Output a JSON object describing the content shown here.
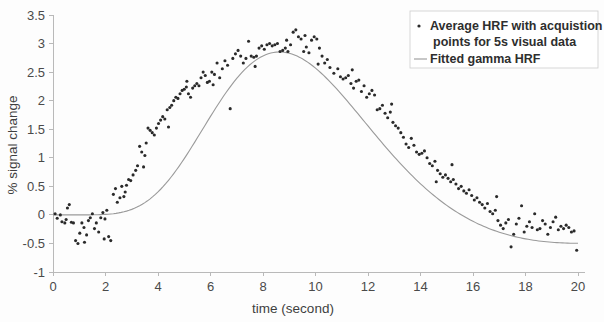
{
  "chart_data": {
    "type": "scatter",
    "title": "",
    "xlabel": "time (second)",
    "ylabel": "% signal change",
    "xlim": [
      0,
      20
    ],
    "ylim": [
      -1,
      3.5
    ],
    "xticks": [
      0,
      2,
      4,
      6,
      8,
      10,
      12,
      14,
      16,
      18,
      20
    ],
    "xtick_labels": [
      "0",
      "2",
      "4",
      "6",
      "8",
      "10",
      "12",
      "14",
      "16",
      "18",
      "20"
    ],
    "yticks": [
      -1,
      -0.5,
      0,
      0.5,
      1,
      1.5,
      2,
      2.5,
      3,
      3.5
    ],
    "ytick_labels": [
      "-1",
      "-0.5",
      "0",
      "0.5",
      "1",
      "1.5",
      "2",
      "2.5",
      "3",
      "3.5"
    ],
    "grid": false,
    "legend_position": "top-right",
    "legend": [
      {
        "id": "scatter-series",
        "marker": "dot",
        "color": "#2a2a2a",
        "label_line1": "Average HRF with acquistion",
        "label_line2": "points for 5s visual data"
      },
      {
        "id": "fit-series",
        "marker": "line",
        "color": "#9a9a9a",
        "label_line1": "Fitted gamma HRF",
        "label_line2": ""
      }
    ],
    "series": [
      {
        "name": "Average HRF with acquistion points for 5s visual data",
        "type": "scatter",
        "color": "#2a2a2a",
        "points": [
          [
            0.08,
            0.02
          ],
          [
            0.16,
            -0.06
          ],
          [
            0.28,
            0.0
          ],
          [
            0.34,
            -0.12
          ],
          [
            0.45,
            -0.14
          ],
          [
            0.55,
            0.12
          ],
          [
            0.62,
            0.18
          ],
          [
            0.7,
            -0.13
          ],
          [
            0.78,
            -0.14
          ],
          [
            0.86,
            -0.45
          ],
          [
            0.95,
            -0.5
          ],
          [
            1.02,
            -0.32
          ],
          [
            1.1,
            -0.14
          ],
          [
            1.18,
            -0.22
          ],
          [
            1.28,
            -0.35
          ],
          [
            1.35,
            -0.1
          ],
          [
            1.42,
            -0.05
          ],
          [
            1.5,
            0.02
          ],
          [
            1.58,
            -0.24
          ],
          [
            1.65,
            -0.14
          ],
          [
            1.74,
            -0.3
          ],
          [
            1.82,
            -0.05
          ],
          [
            1.9,
            0.04
          ],
          [
            1.98,
            -0.07
          ],
          [
            2.05,
            0.08
          ],
          [
            2.12,
            -0.38
          ],
          [
            2.2,
            -0.45
          ],
          [
            2.3,
            0.36
          ],
          [
            2.38,
            0.46
          ],
          [
            2.45,
            0.22
          ],
          [
            2.55,
            0.3
          ],
          [
            2.62,
            0.5
          ],
          [
            2.7,
            0.32
          ],
          [
            2.8,
            0.52
          ],
          [
            2.88,
            0.62
          ],
          [
            2.96,
            0.6
          ],
          [
            3.05,
            0.7
          ],
          [
            3.15,
            0.78
          ],
          [
            3.22,
            0.86
          ],
          [
            3.3,
            1.2
          ],
          [
            3.38,
            1.1
          ],
          [
            3.45,
            0.84
          ],
          [
            3.55,
            1.26
          ],
          [
            3.62,
            1.52
          ],
          [
            3.7,
            1.48
          ],
          [
            3.78,
            1.44
          ],
          [
            3.86,
            1.4
          ],
          [
            3.94,
            1.52
          ],
          [
            4.02,
            1.6
          ],
          [
            4.1,
            1.66
          ],
          [
            4.18,
            1.72
          ],
          [
            4.26,
            1.68
          ],
          [
            4.35,
            1.84
          ],
          [
            4.45,
            1.88
          ],
          [
            4.52,
            1.92
          ],
          [
            4.6,
            2.0
          ],
          [
            4.68,
            2.06
          ],
          [
            4.76,
            2.04
          ],
          [
            4.84,
            2.12
          ],
          [
            4.92,
            2.18
          ],
          [
            5.0,
            2.2
          ],
          [
            5.08,
            2.24
          ],
          [
            5.16,
            2.12
          ],
          [
            5.24,
            2.06
          ],
          [
            5.32,
            2.22
          ],
          [
            5.4,
            2.26
          ],
          [
            5.48,
            2.3
          ],
          [
            5.56,
            2.26
          ],
          [
            5.64,
            2.4
          ],
          [
            5.72,
            2.5
          ],
          [
            5.8,
            2.44
          ],
          [
            5.88,
            2.32
          ],
          [
            5.96,
            2.34
          ],
          [
            6.05,
            2.5
          ],
          [
            6.15,
            2.46
          ],
          [
            6.25,
            2.66
          ],
          [
            6.35,
            2.4
          ],
          [
            6.45,
            2.56
          ],
          [
            6.55,
            2.7
          ],
          [
            6.65,
            2.62
          ],
          [
            6.75,
            1.86
          ],
          [
            6.85,
            2.74
          ],
          [
            6.95,
            2.82
          ],
          [
            7.05,
            2.88
          ],
          [
            7.15,
            2.78
          ],
          [
            7.25,
            2.66
          ],
          [
            7.35,
            2.74
          ],
          [
            7.45,
            3.04
          ],
          [
            7.55,
            2.78
          ],
          [
            7.65,
            2.76
          ],
          [
            7.75,
            2.78
          ],
          [
            7.85,
            2.92
          ],
          [
            7.95,
            2.96
          ],
          [
            8.05,
            2.9
          ],
          [
            8.15,
            2.98
          ],
          [
            8.25,
            3.0
          ],
          [
            8.35,
            2.96
          ],
          [
            8.45,
            2.98
          ],
          [
            8.55,
            3.0
          ],
          [
            8.65,
            2.86
          ],
          [
            8.75,
            2.88
          ],
          [
            8.85,
            2.92
          ],
          [
            8.95,
            2.86
          ],
          [
            9.05,
            2.98
          ],
          [
            9.15,
            3.2
          ],
          [
            9.25,
            3.24
          ],
          [
            9.35,
            3.12
          ],
          [
            9.45,
            3.08
          ],
          [
            9.55,
            2.86
          ],
          [
            9.65,
            2.94
          ],
          [
            9.75,
            2.84
          ],
          [
            9.85,
            3.06
          ],
          [
            9.95,
            3.12
          ],
          [
            10.05,
            3.08
          ],
          [
            10.15,
            2.92
          ],
          [
            10.25,
            2.78
          ],
          [
            10.35,
            2.66
          ],
          [
            10.45,
            2.72
          ],
          [
            10.55,
            2.58
          ],
          [
            10.7,
            2.48
          ],
          [
            10.85,
            2.56
          ],
          [
            10.95,
            2.42
          ],
          [
            11.05,
            2.38
          ],
          [
            11.15,
            2.4
          ],
          [
            11.25,
            2.44
          ],
          [
            11.35,
            2.3
          ],
          [
            11.45,
            2.22
          ],
          [
            11.55,
            2.34
          ],
          [
            11.65,
            2.36
          ],
          [
            11.75,
            2.16
          ],
          [
            11.85,
            2.26
          ],
          [
            11.95,
            2.06
          ],
          [
            12.05,
            2.12
          ],
          [
            12.15,
            2.18
          ],
          [
            12.25,
            2.1
          ],
          [
            12.35,
            1.84
          ],
          [
            12.45,
            1.86
          ],
          [
            12.55,
            1.92
          ],
          [
            12.65,
            1.78
          ],
          [
            12.75,
            1.7
          ],
          [
            12.85,
            1.8
          ],
          [
            12.95,
            1.62
          ],
          [
            13.05,
            1.56
          ],
          [
            13.15,
            1.52
          ],
          [
            13.25,
            1.44
          ],
          [
            13.35,
            1.36
          ],
          [
            13.45,
            1.24
          ],
          [
            13.55,
            1.18
          ],
          [
            13.65,
            1.34
          ],
          [
            13.75,
            1.22
          ],
          [
            13.85,
            1.1
          ],
          [
            13.95,
            1.06
          ],
          [
            14.05,
            1.08
          ],
          [
            14.15,
            1.12
          ],
          [
            14.25,
            1.0
          ],
          [
            14.35,
            0.9
          ],
          [
            14.45,
            0.86
          ],
          [
            14.55,
            0.94
          ],
          [
            14.65,
            0.78
          ],
          [
            14.75,
            0.72
          ],
          [
            14.85,
            0.66
          ],
          [
            14.95,
            0.7
          ],
          [
            15.05,
            0.64
          ],
          [
            15.15,
            0.58
          ],
          [
            15.25,
            0.62
          ],
          [
            15.35,
            0.54
          ],
          [
            15.45,
            0.46
          ],
          [
            15.55,
            0.5
          ],
          [
            15.65,
            0.42
          ],
          [
            15.75,
            0.38
          ],
          [
            15.85,
            0.44
          ],
          [
            15.95,
            0.34
          ],
          [
            16.05,
            0.26
          ],
          [
            16.15,
            0.3
          ],
          [
            16.25,
            0.22
          ],
          [
            16.35,
            0.18
          ],
          [
            16.45,
            0.12
          ],
          [
            16.55,
            0.2
          ],
          [
            16.65,
            0.06
          ],
          [
            16.75,
            0.02
          ],
          [
            16.85,
            0.08
          ],
          [
            16.95,
            -0.1
          ],
          [
            17.05,
            -0.18
          ],
          [
            17.15,
            -0.24
          ],
          [
            17.25,
            -0.14
          ],
          [
            17.35,
            -0.08
          ],
          [
            17.45,
            -0.56
          ],
          [
            17.55,
            -0.34
          ],
          [
            17.65,
            -0.16
          ],
          [
            17.75,
            -0.06
          ],
          [
            17.85,
            0.16
          ],
          [
            17.95,
            -0.3
          ],
          [
            18.05,
            -0.2
          ],
          [
            18.15,
            -0.12
          ],
          [
            18.25,
            -0.22
          ],
          [
            18.35,
            0.02
          ],
          [
            18.45,
            -0.26
          ],
          [
            18.55,
            -0.24
          ],
          [
            18.65,
            -0.1
          ],
          [
            18.75,
            -0.16
          ],
          [
            18.85,
            -0.34
          ],
          [
            18.95,
            -0.22
          ],
          [
            19.05,
            -0.12
          ],
          [
            19.15,
            -0.04
          ],
          [
            19.25,
            -0.26
          ],
          [
            19.35,
            -0.2
          ],
          [
            19.45,
            -0.24
          ],
          [
            19.55,
            -0.18
          ],
          [
            19.65,
            -0.22
          ],
          [
            19.75,
            -0.3
          ],
          [
            19.85,
            -0.28
          ],
          [
            19.95,
            -0.62
          ],
          [
            16.9,
            0.32
          ],
          [
            15.2,
            0.88
          ],
          [
            14.6,
            0.58
          ],
          [
            12.9,
            1.94
          ],
          [
            11.4,
            2.54
          ],
          [
            10.1,
            2.64
          ],
          [
            9.6,
            3.14
          ],
          [
            8.9,
            3.06
          ],
          [
            7.7,
            2.6
          ],
          [
            6.1,
            2.28
          ],
          [
            5.1,
            2.34
          ],
          [
            4.4,
            1.54
          ],
          [
            3.5,
            1.04
          ],
          [
            2.75,
            0.4
          ],
          [
            1.95,
            -0.42
          ],
          [
            1.2,
            -0.48
          ],
          [
            0.5,
            -0.08
          ]
        ]
      },
      {
        "name": "Fitted gamma HRF",
        "type": "line",
        "color": "#9a9a9a",
        "description": "Gamma-shaped fitted hemodynamic response curve rising from 0 at t=0, peaking near 2.95 around t=8.8s, and decaying to about -0.2 by t=20s"
      }
    ]
  },
  "axes": {
    "y_axis_title": "% signal change",
    "x_axis_title": "time (second)"
  }
}
